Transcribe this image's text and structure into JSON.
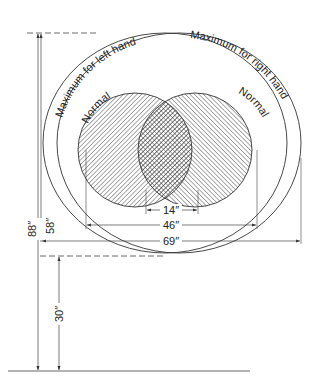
{
  "diagram": {
    "labels": {
      "max_left": "Maximum for left hand",
      "max_right": "Maximum for right hand",
      "normal_left": "Normal",
      "normal_right": "Normal"
    },
    "dimensions": {
      "overlap": "14″",
      "normal_span": "46″",
      "max_span": "69″",
      "max_reach_height": "88″",
      "normal_reach_height": "58″",
      "table_height": "30″"
    },
    "colors": {
      "line": "#333333",
      "hatch": "#444444",
      "background": "#ffffff"
    }
  }
}
